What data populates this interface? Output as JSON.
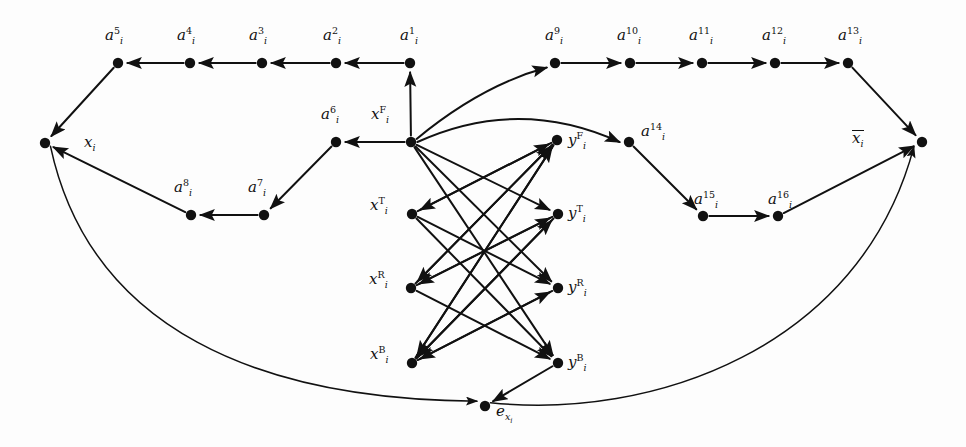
{
  "figure": {
    "type": "directed-graph-diagram",
    "background_color": "#fdfdfd",
    "ink_color": "#111111"
  },
  "nodes": [
    {
      "id": "a5",
      "label_base": "a",
      "sup": "5",
      "sub": "i",
      "x": 118,
      "y": 63,
      "lx": 105,
      "ly": 26
    },
    {
      "id": "a4",
      "label_base": "a",
      "sup": "4",
      "sub": "i",
      "x": 190,
      "y": 63,
      "lx": 177,
      "ly": 26
    },
    {
      "id": "a3",
      "label_base": "a",
      "sup": "3",
      "sub": "i",
      "x": 262,
      "y": 63,
      "lx": 249,
      "ly": 26
    },
    {
      "id": "a2",
      "label_base": "a",
      "sup": "2",
      "sub": "i",
      "x": 336,
      "y": 63,
      "lx": 323,
      "ly": 26
    },
    {
      "id": "a1",
      "label_base": "a",
      "sup": "1",
      "sub": "i",
      "x": 410,
      "y": 63,
      "lx": 400,
      "ly": 26
    },
    {
      "id": "a9",
      "label_base": "a",
      "sup": "9",
      "sub": "i",
      "x": 555,
      "y": 63,
      "lx": 545,
      "ly": 26
    },
    {
      "id": "a10",
      "label_base": "a",
      "sup": "10",
      "sub": "i",
      "x": 630,
      "y": 63,
      "lx": 617,
      "ly": 26
    },
    {
      "id": "a11",
      "label_base": "a",
      "sup": "11",
      "sub": "i",
      "x": 702,
      "y": 63,
      "lx": 689,
      "ly": 26
    },
    {
      "id": "a12",
      "label_base": "a",
      "sup": "12",
      "sub": "i",
      "x": 775,
      "y": 63,
      "lx": 762,
      "ly": 26
    },
    {
      "id": "a13",
      "label_base": "a",
      "sup": "13",
      "sub": "i",
      "x": 848,
      "y": 63,
      "lx": 838,
      "ly": 26
    },
    {
      "id": "xi",
      "label_base": "x",
      "sup": "",
      "sub": "i",
      "x": 45,
      "y": 143,
      "lx": 84,
      "ly": 135
    },
    {
      "id": "a6",
      "label_base": "a",
      "sup": "6",
      "sub": "i",
      "x": 336,
      "y": 142,
      "lx": 321,
      "ly": 105
    },
    {
      "id": "xF",
      "label_base": "x",
      "sup": "F",
      "sub": "i",
      "x": 411,
      "y": 142,
      "lx": 371,
      "ly": 105
    },
    {
      "id": "yF",
      "label_base": "y",
      "sup": "F",
      "sub": "i",
      "x": 557,
      "y": 140,
      "lx": 568,
      "ly": 131
    },
    {
      "id": "a14",
      "label_base": "a",
      "sup": "14",
      "sub": "i",
      "x": 629,
      "y": 142,
      "lx": 641,
      "ly": 122
    },
    {
      "id": "xbar",
      "label_base": "x",
      "sup": "",
      "sub": "i",
      "x": 922,
      "y": 142,
      "lx": 852,
      "ly": 130,
      "overline": true
    },
    {
      "id": "a8",
      "label_base": "a",
      "sup": "8",
      "sub": "i",
      "x": 191,
      "y": 215,
      "lx": 174,
      "ly": 178
    },
    {
      "id": "a7",
      "label_base": "a",
      "sup": "7",
      "sub": "i",
      "x": 264,
      "y": 215,
      "lx": 248,
      "ly": 178
    },
    {
      "id": "xT",
      "label_base": "x",
      "sup": "T",
      "sub": "i",
      "x": 412,
      "y": 214,
      "lx": 370,
      "ly": 196
    },
    {
      "id": "yT",
      "label_base": "y",
      "sup": "T",
      "sub": "i",
      "x": 558,
      "y": 214,
      "lx": 568,
      "ly": 204
    },
    {
      "id": "a15",
      "label_base": "a",
      "sup": "15",
      "sub": "i",
      "x": 703,
      "y": 216,
      "lx": 694,
      "ly": 190
    },
    {
      "id": "a16",
      "label_base": "a",
      "sup": "16",
      "sub": "i",
      "x": 778,
      "y": 216,
      "lx": 768,
      "ly": 190
    },
    {
      "id": "xR",
      "label_base": "x",
      "sup": "R",
      "sub": "i",
      "x": 411,
      "y": 288,
      "lx": 369,
      "ly": 270
    },
    {
      "id": "yR",
      "label_base": "y",
      "sup": "R",
      "sub": "i",
      "x": 558,
      "y": 288,
      "lx": 568,
      "ly": 278
    },
    {
      "id": "xB",
      "label_base": "x",
      "sup": "B",
      "sub": "i",
      "x": 412,
      "y": 363,
      "lx": 370,
      "ly": 345
    },
    {
      "id": "yB",
      "label_base": "y",
      "sup": "B",
      "sub": "i",
      "x": 558,
      "y": 363,
      "lx": 568,
      "ly": 353
    },
    {
      "id": "ex",
      "label_base": "e",
      "sup": "",
      "sub": "xi",
      "x": 485,
      "y": 406,
      "lx": 496,
      "ly": 404
    }
  ],
  "node_labels": [
    {
      "for": "a5",
      "text": "a5i"
    },
    {
      "for": "a4",
      "text": "a4i"
    },
    {
      "for": "a3",
      "text": "a3i"
    },
    {
      "for": "a2",
      "text": "a2i"
    },
    {
      "for": "a1",
      "text": "a1i"
    },
    {
      "for": "a9",
      "text": "a9i"
    },
    {
      "for": "a10",
      "text": "a10i"
    },
    {
      "for": "a11",
      "text": "a11i"
    },
    {
      "for": "a12",
      "text": "a12i"
    },
    {
      "for": "a13",
      "text": "a13i"
    },
    {
      "for": "xi",
      "text": "xi"
    },
    {
      "for": "a6",
      "text": "a6i"
    },
    {
      "for": "xF",
      "text": "xFi"
    },
    {
      "for": "yF",
      "text": "yFi"
    },
    {
      "for": "a14",
      "text": "a14i"
    },
    {
      "for": "xbar",
      "text": "xi-bar"
    },
    {
      "for": "a8",
      "text": "a8i"
    },
    {
      "for": "a7",
      "text": "a7i"
    },
    {
      "for": "xT",
      "text": "xTi"
    },
    {
      "for": "yT",
      "text": "yTi"
    },
    {
      "for": "a15",
      "text": "a15i"
    },
    {
      "for": "a16",
      "text": "a16i"
    },
    {
      "for": "xR",
      "text": "xRi"
    },
    {
      "for": "yR",
      "text": "yRi"
    },
    {
      "for": "xB",
      "text": "xBi"
    },
    {
      "for": "yB",
      "text": "yBi"
    },
    {
      "for": "ex",
      "text": "exi"
    }
  ],
  "edges": [
    {
      "from": "a1",
      "to": "a2",
      "kind": "straight"
    },
    {
      "from": "a2",
      "to": "a3",
      "kind": "straight"
    },
    {
      "from": "a3",
      "to": "a4",
      "kind": "straight"
    },
    {
      "from": "a4",
      "to": "a5",
      "kind": "straight"
    },
    {
      "from": "a5",
      "to": "xi",
      "kind": "straight"
    },
    {
      "from": "xF",
      "to": "a1",
      "kind": "straight"
    },
    {
      "from": "xF",
      "to": "a6",
      "kind": "straight"
    },
    {
      "from": "a6",
      "to": "a7",
      "kind": "straight"
    },
    {
      "from": "a7",
      "to": "a8",
      "kind": "straight"
    },
    {
      "from": "a8",
      "to": "xi",
      "kind": "straight"
    },
    {
      "from": "xF",
      "to": "a9",
      "kind": "curve"
    },
    {
      "from": "xF",
      "to": "a14",
      "kind": "curve"
    },
    {
      "from": "a9",
      "to": "a10",
      "kind": "straight"
    },
    {
      "from": "a10",
      "to": "a11",
      "kind": "straight"
    },
    {
      "from": "a11",
      "to": "a12",
      "kind": "straight"
    },
    {
      "from": "a12",
      "to": "a13",
      "kind": "straight"
    },
    {
      "from": "a13",
      "to": "xbar",
      "kind": "straight"
    },
    {
      "from": "a14",
      "to": "a15",
      "kind": "straight"
    },
    {
      "from": "a15",
      "to": "a16",
      "kind": "straight"
    },
    {
      "from": "a16",
      "to": "xbar",
      "kind": "straight"
    },
    {
      "from": "xi",
      "to": "ex",
      "kind": "curve-long"
    },
    {
      "from": "ex",
      "to": "xbar",
      "kind": "curve-long"
    },
    {
      "from": "xF",
      "to": "yT",
      "kind": "straight"
    },
    {
      "from": "xF",
      "to": "yR",
      "kind": "straight"
    },
    {
      "from": "xF",
      "to": "yB",
      "kind": "straight"
    },
    {
      "from": "xT",
      "to": "yF",
      "kind": "straight"
    },
    {
      "from": "xT",
      "to": "yR",
      "kind": "straight"
    },
    {
      "from": "xT",
      "to": "yB",
      "kind": "straight"
    },
    {
      "from": "xR",
      "to": "yF",
      "kind": "straight"
    },
    {
      "from": "xR",
      "to": "yT",
      "kind": "straight"
    },
    {
      "from": "xR",
      "to": "yB",
      "kind": "straight"
    },
    {
      "from": "xB",
      "to": "yF",
      "kind": "straight"
    },
    {
      "from": "xB",
      "to": "yT",
      "kind": "straight"
    },
    {
      "from": "xB",
      "to": "yR",
      "kind": "straight"
    },
    {
      "from": "yF",
      "to": "xT",
      "kind": "straight"
    },
    {
      "from": "yF",
      "to": "xR",
      "kind": "straight"
    },
    {
      "from": "yF",
      "to": "xB",
      "kind": "straight"
    },
    {
      "from": "yT",
      "to": "xR",
      "kind": "straight"
    },
    {
      "from": "yT",
      "to": "xB",
      "kind": "straight"
    },
    {
      "from": "yR",
      "to": "xB",
      "kind": "straight"
    },
    {
      "from": "yB",
      "to": "ex",
      "kind": "straight"
    }
  ]
}
